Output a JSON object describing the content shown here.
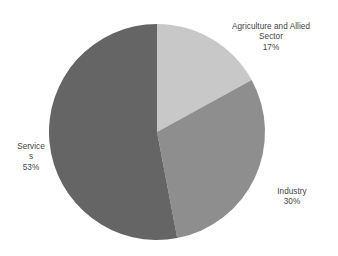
{
  "chart_data": {
    "type": "pie",
    "title": "",
    "categories": [
      "Agriculture and Allied Sector",
      "Industry",
      "Services"
    ],
    "values": [
      17,
      30,
      53
    ],
    "value_unit": "%",
    "start_angle_deg": 0,
    "direction": "clockwise",
    "legend": "none",
    "grid": false,
    "colors": [
      "#c8c8c8",
      "#8e8e8e",
      "#656565"
    ],
    "background": "#ffffff",
    "label_color": "#3f3f3f",
    "slices": [
      {
        "name": "Agriculture and Allied Sector",
        "value": 17,
        "percent_label": "17%",
        "label_text": "Agriculture and Allied\nSector",
        "color": "#c8c8c8",
        "start_deg": 0,
        "end_deg": 61.2
      },
      {
        "name": "Industry",
        "value": 30,
        "percent_label": "30%",
        "label_text": "Industry",
        "color": "#8e8e8e",
        "start_deg": 61.2,
        "end_deg": 169.2
      },
      {
        "name": "Services",
        "value": 53,
        "percent_label": "53%",
        "label_text": "Service\ns",
        "color": "#656565",
        "start_deg": 169.2,
        "end_deg": 360
      }
    ]
  },
  "geometry": {
    "center_x": 157,
    "center_y": 132,
    "radius": 108
  }
}
